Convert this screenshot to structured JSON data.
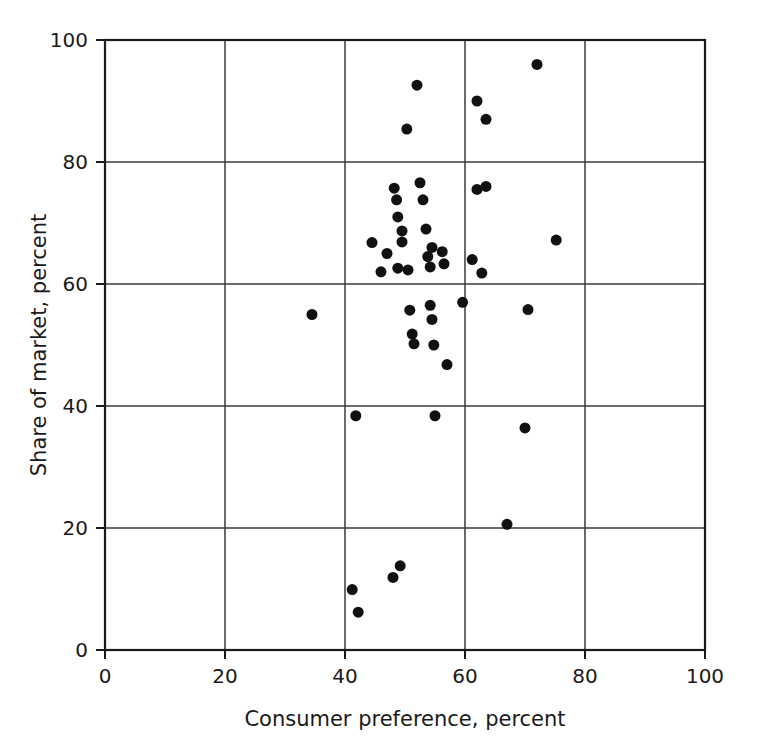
{
  "chart_data": {
    "type": "scatter",
    "title": "",
    "xlabel": "Consumer preference, percent",
    "ylabel": "Share of market, percent",
    "xlim": [
      0,
      100
    ],
    "ylim": [
      0,
      100
    ],
    "xticks": [
      0,
      20,
      40,
      60,
      80,
      100
    ],
    "yticks": [
      0,
      20,
      40,
      60,
      80,
      100
    ],
    "xtick_labels": [
      "0",
      "20",
      "40",
      "60",
      "80",
      "100"
    ],
    "ytick_labels": [
      "0",
      "20",
      "40",
      "60",
      "80",
      "100"
    ],
    "grid": true,
    "grid_style": "solid interior lines at every major tick",
    "legend": null,
    "legend_position": "none",
    "marker": {
      "shape": "circle",
      "color": "#111111",
      "size_px": 11,
      "filled": true
    },
    "series": [
      {
        "name": "Brands",
        "n_points": 45,
        "points": [
          {
            "x": 34.5,
            "y": 55.0
          },
          {
            "x": 41.8,
            "y": 38.4
          },
          {
            "x": 41.2,
            "y": 9.9
          },
          {
            "x": 42.2,
            "y": 6.2
          },
          {
            "x": 44.5,
            "y": 66.8
          },
          {
            "x": 46.0,
            "y": 62.0
          },
          {
            "x": 47.0,
            "y": 65.0
          },
          {
            "x": 48.2,
            "y": 75.7
          },
          {
            "x": 48.6,
            "y": 73.8
          },
          {
            "x": 48.8,
            "y": 71.0
          },
          {
            "x": 48.8,
            "y": 62.6
          },
          {
            "x": 48.0,
            "y": 11.9
          },
          {
            "x": 49.2,
            "y": 13.8
          },
          {
            "x": 49.5,
            "y": 68.7
          },
          {
            "x": 49.5,
            "y": 66.9
          },
          {
            "x": 50.3,
            "y": 85.4
          },
          {
            "x": 50.5,
            "y": 62.3
          },
          {
            "x": 50.8,
            "y": 55.7
          },
          {
            "x": 51.2,
            "y": 51.8
          },
          {
            "x": 51.5,
            "y": 50.2
          },
          {
            "x": 52.0,
            "y": 92.6
          },
          {
            "x": 52.5,
            "y": 76.6
          },
          {
            "x": 53.0,
            "y": 73.8
          },
          {
            "x": 53.5,
            "y": 69.0
          },
          {
            "x": 53.8,
            "y": 64.5
          },
          {
            "x": 54.2,
            "y": 62.8
          },
          {
            "x": 54.5,
            "y": 66.0
          },
          {
            "x": 54.2,
            "y": 56.5
          },
          {
            "x": 54.5,
            "y": 54.2
          },
          {
            "x": 54.8,
            "y": 50.0
          },
          {
            "x": 55.0,
            "y": 38.4
          },
          {
            "x": 56.2,
            "y": 65.3
          },
          {
            "x": 56.5,
            "y": 63.3
          },
          {
            "x": 57.0,
            "y": 46.8
          },
          {
            "x": 59.6,
            "y": 57.0
          },
          {
            "x": 61.2,
            "y": 64.0
          },
          {
            "x": 62.0,
            "y": 90.0
          },
          {
            "x": 62.0,
            "y": 75.5
          },
          {
            "x": 62.8,
            "y": 61.8
          },
          {
            "x": 63.5,
            "y": 76.0
          },
          {
            "x": 63.5,
            "y": 87.0
          },
          {
            "x": 67.0,
            "y": 20.6
          },
          {
            "x": 70.0,
            "y": 36.4
          },
          {
            "x": 70.5,
            "y": 55.8
          },
          {
            "x": 72.0,
            "y": 96.0
          },
          {
            "x": 75.2,
            "y": 67.2
          }
        ]
      }
    ]
  },
  "axes": {
    "y_origin_label": "0",
    "x_origin_label": "0"
  }
}
